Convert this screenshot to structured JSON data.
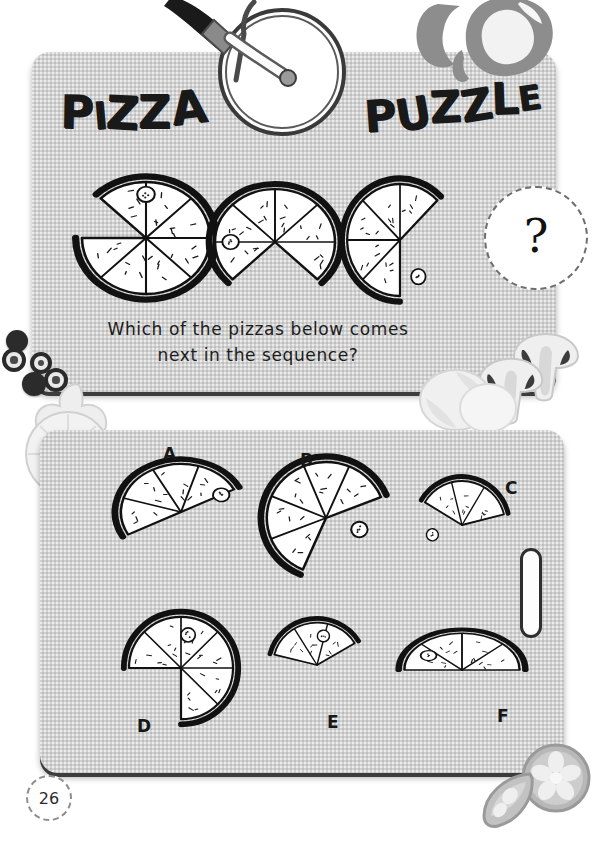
{
  "page": {
    "number": "26",
    "background_color": "#ffffff",
    "board_color": "#d2d2d2"
  },
  "header": {
    "title_word_1": "PIZZA",
    "title_word_2": "PUZZLE",
    "title_full": "PIZZA PUZZLE",
    "cutter_icon": "pizza-cutter-icon"
  },
  "question": {
    "line_1": "Which of the pizzas below comes",
    "line_2": "next in the sequence?",
    "full_text": "Which of the pizzas below comes next in the sequence?",
    "answer_placeholder": "?"
  },
  "sequence": {
    "label": "pizza sequence",
    "items": [
      {
        "name": "sequence-pizza-1",
        "slices_remaining": 7,
        "slices_total": 8,
        "missing_start_deg": 180,
        "missing_end_deg": 225,
        "pepperoni_angle_deg": 270,
        "pepperoni_radius_pct": 78
      },
      {
        "name": "sequence-pizza-2",
        "slices_remaining": 6,
        "slices_total": 8,
        "missing_start_deg": 45,
        "missing_end_deg": 135,
        "pepperoni_angle_deg": 180,
        "pepperoni_radius_pct": 74
      },
      {
        "name": "sequence-pizza-3",
        "slices_remaining": 5,
        "slices_total": 8,
        "missing_start_deg": 315,
        "missing_end_deg": 90,
        "pepperoni_angle_deg": 62,
        "pepperoni_radius_pct": 74
      }
    ]
  },
  "options": {
    "label": "answer options",
    "items": [
      {
        "letter": "A",
        "name": "option-a",
        "slices_remaining": 4,
        "slices_total": 8,
        "rotation_deg": -28,
        "start_deg": 180,
        "pepperoni_angle_deg": 0,
        "pepperoni_radius_pct": 76
      },
      {
        "letter": "B",
        "name": "option-b",
        "slices_remaining": 5,
        "slices_total": 8,
        "rotation_deg": -22,
        "start_deg": 135,
        "pepperoni_angle_deg": 42,
        "pepperoni_radius_pct": 60
      },
      {
        "letter": "C",
        "name": "option-c",
        "slices_remaining": 3,
        "slices_total": 8,
        "rotation_deg": -14,
        "start_deg": 225,
        "pepperoni_angle_deg": 176,
        "pepperoni_radius_pct": 72
      },
      {
        "letter": "D",
        "name": "option-d",
        "slices_remaining": 6,
        "slices_total": 8,
        "rotation_deg": 0,
        "start_deg": 180,
        "pepperoni_angle_deg": 282,
        "pepperoni_radius_pct": 66
      },
      {
        "letter": "E",
        "name": "option-e",
        "slices_remaining": 3,
        "slices_total": 8,
        "rotation_deg": -8,
        "start_deg": 202,
        "pepperoni_angle_deg": 290,
        "pepperoni_radius_pct": 70
      },
      {
        "letter": "F",
        "name": "option-f",
        "slices_remaining": 4,
        "slices_total": 8,
        "rotation_deg": 0,
        "start_deg": 180,
        "pepperoni_angle_deg": 214,
        "pepperoni_radius_pct": 70
      }
    ]
  },
  "decorations": {
    "olives": [
      "olive-solid",
      "olive-ring",
      "olive-ring",
      "olive-ring",
      "olive-solid"
    ],
    "mushrooms": [
      "mushroom-icon",
      "mushroom-icon"
    ],
    "pepper_rings": [
      "pepper-ring-icon",
      "pepper-ring-icon"
    ],
    "onion_rings": [
      "onion-ring-icon",
      "onion-ring-icon"
    ],
    "citrus_slices": [
      "citrus-slice-icon",
      "citrus-half-icon"
    ]
  }
}
